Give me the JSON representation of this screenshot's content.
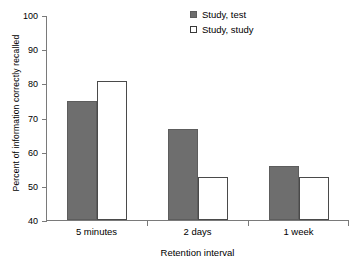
{
  "chart_data": {
    "type": "bar",
    "title": "",
    "xlabel": "Retention interval",
    "ylabel": "Percent of information correctly recalled",
    "categories": [
      "5 minutes",
      "2 days",
      "1 week"
    ],
    "series": [
      {
        "name": "Study, test",
        "values": [
          75,
          67,
          56
        ],
        "color": "#6e6e6e",
        "style": "filled"
      },
      {
        "name": "Study, study",
        "values": [
          81,
          53,
          53
        ],
        "color": "#ffffff",
        "style": "open"
      }
    ],
    "ylim": [
      40,
      100
    ],
    "ytick_values": [
      40,
      50,
      60,
      70,
      80,
      90,
      100
    ],
    "ytick_labels": [
      "40",
      "50",
      "60",
      "70",
      "80",
      "90",
      "100"
    ],
    "ystep": 10,
    "grid": false,
    "legend_position": "top-right-inside"
  },
  "legend": {
    "items": [
      {
        "label": "Study, test"
      },
      {
        "label": "Study, study"
      }
    ]
  },
  "axes": {
    "x_title": "Retention interval",
    "y_title": "Percent of information correctly recalled"
  }
}
